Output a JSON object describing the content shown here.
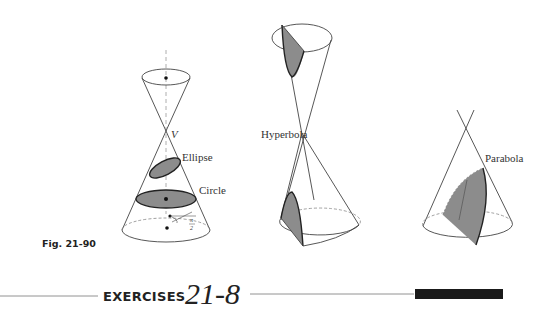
{
  "figure": {
    "caption": "Fig. 21-90",
    "labels": {
      "vertex": "V",
      "ellipse": "Ellipse",
      "circle": "Circle",
      "hyperbola": "Hyperbola",
      "parabola": "Parabola",
      "angle_num": "π",
      "angle_den": "2"
    },
    "colors": {
      "line": "#333333",
      "section_fill": "#8c8c8c",
      "dashed": "#888888"
    }
  },
  "section_header": {
    "prefix": "EXERCISES",
    "number": "21-8",
    "bar_color": "#1a1a1a"
  }
}
